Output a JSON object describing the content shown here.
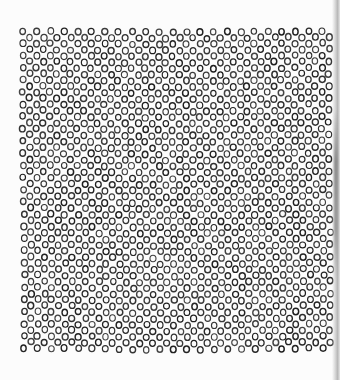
{
  "figure": {
    "type": "circle-lattice-pattern",
    "background_color": "#fcfcfc",
    "ring_color": "#2a2a2a",
    "region": {
      "x": 20,
      "y": 28,
      "width": 313,
      "height": 330
    },
    "ring_diameter": 7,
    "ring_stroke": 1.3,
    "column_spacing": 13.6,
    "row_pitch": 6.1,
    "alternate_row_offset": 6.8,
    "jitter": 1.2,
    "seed": 7
  },
  "edge_shadow": {
    "visible": true,
    "side": "right",
    "color": "#9a9a9a"
  }
}
